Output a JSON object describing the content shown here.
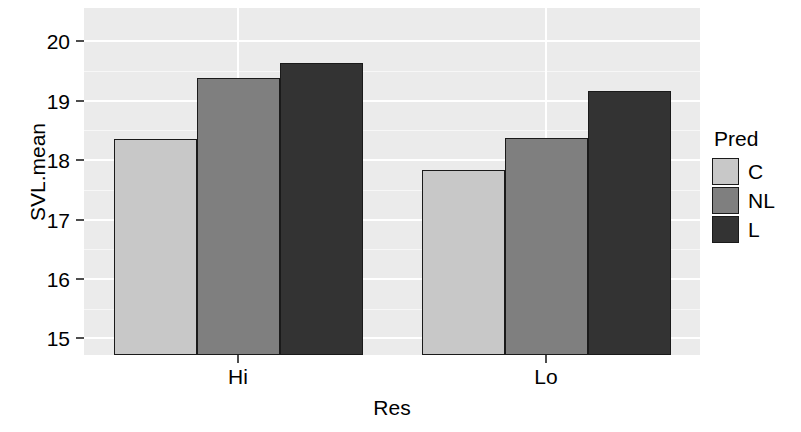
{
  "chart_data": {
    "type": "bar",
    "title": "",
    "xlabel": "Res",
    "ylabel": "SVL.mean",
    "categories": [
      "Hi",
      "Lo"
    ],
    "legend_title": "Pred",
    "legend_position": "right",
    "grid": true,
    "ylim": [
      14.72,
      20.56
    ],
    "yticks": [
      15,
      16,
      17,
      18,
      19,
      20
    ],
    "ytick_labels": [
      "15",
      "16",
      "17",
      "18",
      "19",
      "20"
    ],
    "y_minor_ticks": [
      15.5,
      16.5,
      17.5,
      18.5,
      19.5
    ],
    "series": [
      {
        "name": "C",
        "color": "#c8c8c8",
        "values": [
          18.35,
          17.83
        ]
      },
      {
        "name": "NL",
        "color": "#7f7f7f",
        "values": [
          19.38,
          18.38
        ]
      },
      {
        "name": "L",
        "color": "#333333",
        "values": [
          19.63,
          19.16
        ]
      }
    ],
    "bars": [
      {
        "group": "Hi",
        "series": "C",
        "value": 18.35,
        "color": "#c8c8c8"
      },
      {
        "group": "Hi",
        "series": "NL",
        "value": 19.38,
        "color": "#7f7f7f"
      },
      {
        "group": "Hi",
        "series": "L",
        "value": 19.63,
        "color": "#333333"
      },
      {
        "group": "Lo",
        "series": "C",
        "value": 17.83,
        "color": "#c8c8c8"
      },
      {
        "group": "Lo",
        "series": "NL",
        "value": 18.38,
        "color": "#7f7f7f"
      },
      {
        "group": "Lo",
        "series": "L",
        "value": 19.16,
        "color": "#333333"
      }
    ],
    "panel_background": "#ebebeb",
    "gridline_color": "#ffffff",
    "bar_outline_color": "#1a1a1a",
    "axis_text_color": "#000000"
  }
}
